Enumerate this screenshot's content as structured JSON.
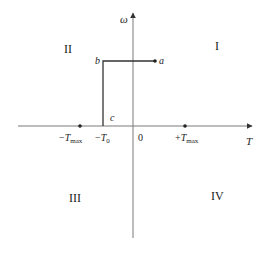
{
  "diagram": {
    "type": "four-quadrant torque-speed plane",
    "axes": {
      "vertical_label": "ω",
      "horizontal_label": "T",
      "origin_label": "0"
    },
    "quadrants": {
      "q1": "I",
      "q2": "II",
      "q3": "III",
      "q4": "IV"
    },
    "points": {
      "a": "a",
      "b": "b",
      "c": "c"
    },
    "ticks": {
      "neg_tmax": {
        "sign": "−",
        "symbol": "T",
        "sub": "max"
      },
      "neg_t0": {
        "sign": "−",
        "symbol": "T",
        "sub": "0"
      },
      "pos_tmax": {
        "sign": "+",
        "symbol": "T",
        "sub": "max"
      }
    },
    "colors": {
      "axis": "#7a7a7a",
      "path": "#333333",
      "text": "#222222"
    }
  }
}
